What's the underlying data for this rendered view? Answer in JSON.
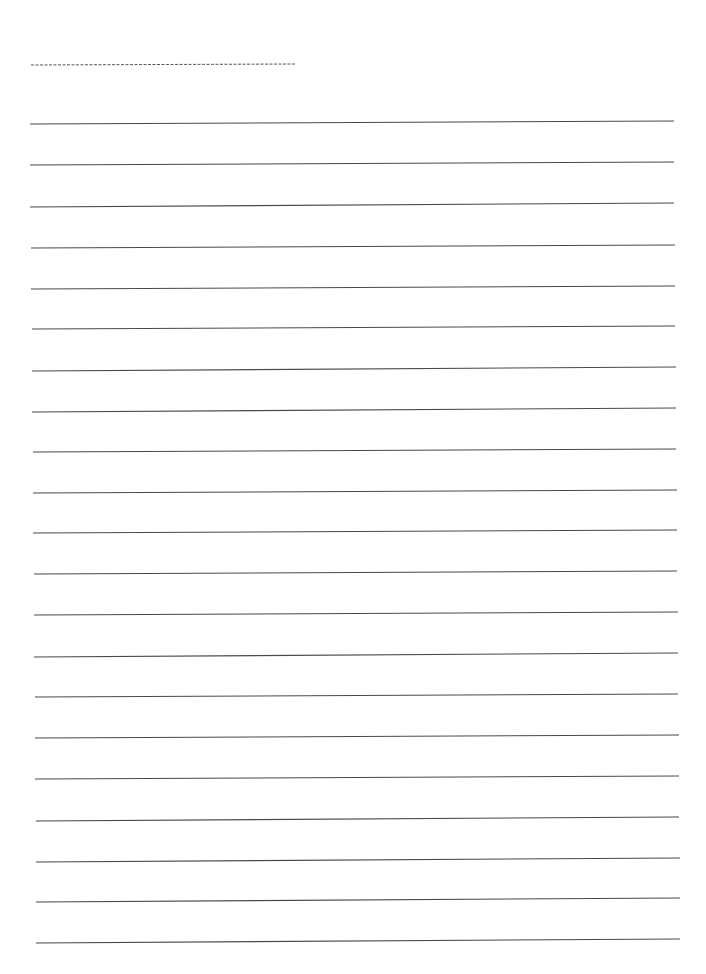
{
  "page": {
    "width": 706,
    "height": 974,
    "background": "#ffffff",
    "type": "blank lined writing paper"
  },
  "header_line": {
    "style": "dashed",
    "color": "#555555",
    "x1": 31,
    "y1": 65,
    "x2": 296,
    "y2": 64,
    "dash": "3 1.5",
    "text": ""
  },
  "ruled_lines": {
    "color": "#4a4a4a",
    "stroke_width": 1.1,
    "count": 21,
    "lines": [
      {
        "x1": 30,
        "y1": 124,
        "x2": 674,
        "y2": 121,
        "text": ""
      },
      {
        "x1": 30,
        "y1": 165,
        "x2": 674,
        "y2": 162,
        "text": ""
      },
      {
        "x1": 30,
        "y1": 207,
        "x2": 674,
        "y2": 203,
        "text": ""
      },
      {
        "x1": 31,
        "y1": 248,
        "x2": 675,
        "y2": 245,
        "text": ""
      },
      {
        "x1": 31,
        "y1": 289,
        "x2": 675,
        "y2": 286,
        "text": ""
      },
      {
        "x1": 32,
        "y1": 329,
        "x2": 675,
        "y2": 326,
        "text": ""
      },
      {
        "x1": 32,
        "y1": 371,
        "x2": 676,
        "y2": 367,
        "text": ""
      },
      {
        "x1": 32,
        "y1": 412,
        "x2": 676,
        "y2": 408,
        "text": ""
      },
      {
        "x1": 33,
        "y1": 452,
        "x2": 676,
        "y2": 449,
        "text": ""
      },
      {
        "x1": 33,
        "y1": 493,
        "x2": 677,
        "y2": 490,
        "text": ""
      },
      {
        "x1": 33,
        "y1": 533,
        "x2": 677,
        "y2": 530,
        "text": ""
      },
      {
        "x1": 34,
        "y1": 574,
        "x2": 677,
        "y2": 571,
        "text": ""
      },
      {
        "x1": 34,
        "y1": 615,
        "x2": 678,
        "y2": 612,
        "text": ""
      },
      {
        "x1": 34,
        "y1": 657,
        "x2": 678,
        "y2": 653,
        "text": ""
      },
      {
        "x1": 35,
        "y1": 697,
        "x2": 678,
        "y2": 694,
        "text": ""
      },
      {
        "x1": 35,
        "y1": 738,
        "x2": 679,
        "y2": 735,
        "text": ""
      },
      {
        "x1": 35,
        "y1": 779,
        "x2": 679,
        "y2": 776,
        "text": ""
      },
      {
        "x1": 36,
        "y1": 821,
        "x2": 679,
        "y2": 817,
        "text": ""
      },
      {
        "x1": 36,
        "y1": 862,
        "x2": 680,
        "y2": 858,
        "text": ""
      },
      {
        "x1": 36,
        "y1": 902,
        "x2": 680,
        "y2": 898,
        "text": ""
      },
      {
        "x1": 36,
        "y1": 943,
        "x2": 680,
        "y2": 939,
        "text": ""
      }
    ]
  }
}
